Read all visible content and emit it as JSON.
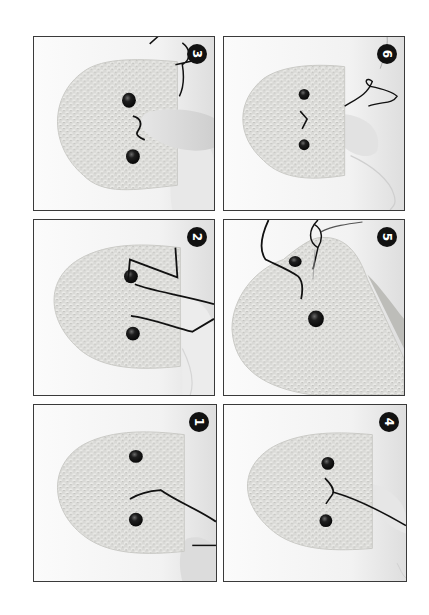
{
  "page": {
    "background": "#ffffff",
    "frame_color": "#3a3a3a",
    "badge_color": "#111111",
    "badge_text_color": "#ffffff"
  },
  "figure": {
    "orientation": "rotated-90",
    "rows": 3,
    "columns": 2,
    "panels": [
      {
        "step": "3",
        "caption_icon": "step-number-badge",
        "description": "Two safety eyes placed; embroidered V-shaped nose stitched between the eyes; finger holding the head; yarn tails at the open edge"
      },
      {
        "step": "6",
        "caption_icon": "step-number-badge",
        "description": "Finished face with two eyes and V-shaped nose; loose black yarn tails and light yarn tail trailing from open edge"
      },
      {
        "step": "2",
        "caption_icon": "step-number-badge",
        "description": "Black yarn threaded around the first eye and down toward the second eye"
      },
      {
        "step": "5",
        "caption_icon": "step-number-badge",
        "description": "Head tilted; yarn pulled out near upper eye while knotting thread tails"
      },
      {
        "step": "1",
        "caption_icon": "step-number-badge",
        "description": "Two safety eyes in crocheted head; black yarn inserted from the open edge emerging between the eyes"
      },
      {
        "step": "4",
        "caption_icon": "step-number-badge",
        "description": "Yarn forms first leg of the V-shaped nose between the eyes"
      }
    ]
  }
}
